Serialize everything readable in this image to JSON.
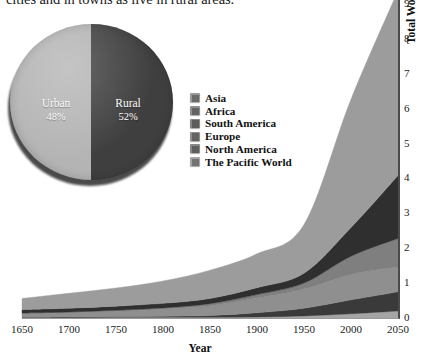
{
  "page": {
    "body_text_fragment": "cities and in towns as live in rural areas."
  },
  "pie": {
    "name": "urban-rural-pie-chart",
    "slices": [
      {
        "label": "Urban",
        "percent": "48%",
        "value": 48,
        "color": "#b4b4b4"
      },
      {
        "label": "Rural",
        "percent": "52%",
        "value": 52,
        "color": "#3f3f3f"
      }
    ]
  },
  "legend": {
    "items": [
      {
        "label": "Asia",
        "color": "#9a9a9a"
      },
      {
        "label": "Africa",
        "color": "#8f8f8f"
      },
      {
        "label": "South America",
        "color": "#868686"
      },
      {
        "label": "Europe",
        "color": "#909090"
      },
      {
        "label": "North America",
        "color": "#888888"
      },
      {
        "label": "The Pacific World",
        "color": "#a5a5a5"
      }
    ]
  },
  "axes": {
    "y_title_main": "Total World Population",
    "y_title_units": "(in billions)",
    "x_title": "Year",
    "y_ticks": [
      "0",
      "1",
      "2",
      "3",
      "4",
      "5",
      "6",
      "7",
      "8"
    ],
    "x_ticks": [
      "1650",
      "1700",
      "1750",
      "1800",
      "1850",
      "1900",
      "1950",
      "2000",
      "2050"
    ]
  },
  "chart_data": {
    "type": "area",
    "title": "",
    "subtitle": "",
    "xlabel": "Year",
    "ylabel": "Total World Population (in billions)",
    "xlim": [
      1650,
      2050
    ],
    "ylim": [
      0,
      9
    ],
    "grid": false,
    "stacked": true,
    "legend_position": "center-left",
    "x": [
      1650,
      1700,
      1750,
      1800,
      1850,
      1900,
      1950,
      2000,
      2050
    ],
    "series": [
      {
        "name": "The Pacific World",
        "color": "#a5a5a5",
        "values": [
          0.01,
          0.01,
          0.02,
          0.02,
          0.02,
          0.03,
          0.06,
          0.12,
          0.2
        ]
      },
      {
        "name": "North America",
        "color": "#3a3a3a",
        "values": [
          0.01,
          0.02,
          0.02,
          0.03,
          0.05,
          0.12,
          0.22,
          0.4,
          0.55
        ]
      },
      {
        "name": "Europe",
        "color": "#8f8f8f",
        "values": [
          0.1,
          0.12,
          0.15,
          0.2,
          0.28,
          0.42,
          0.55,
          0.73,
          0.72
        ]
      },
      {
        "name": "South America",
        "color": "#7f7f7f",
        "values": [
          0.02,
          0.02,
          0.03,
          0.04,
          0.06,
          0.1,
          0.17,
          0.52,
          0.81
        ]
      },
      {
        "name": "Africa",
        "color": "#2f2f2f",
        "values": [
          0.1,
          0.11,
          0.12,
          0.13,
          0.15,
          0.2,
          0.28,
          0.82,
          1.8
        ]
      },
      {
        "name": "Asia",
        "color": "#9c9c9c",
        "values": [
          0.32,
          0.43,
          0.52,
          0.64,
          0.81,
          0.97,
          1.4,
          3.68,
          5.3
        ]
      }
    ],
    "totals": [
      0.56,
      0.71,
      0.86,
      1.06,
      1.37,
      1.84,
      2.68,
      6.27,
      9.38
    ]
  }
}
